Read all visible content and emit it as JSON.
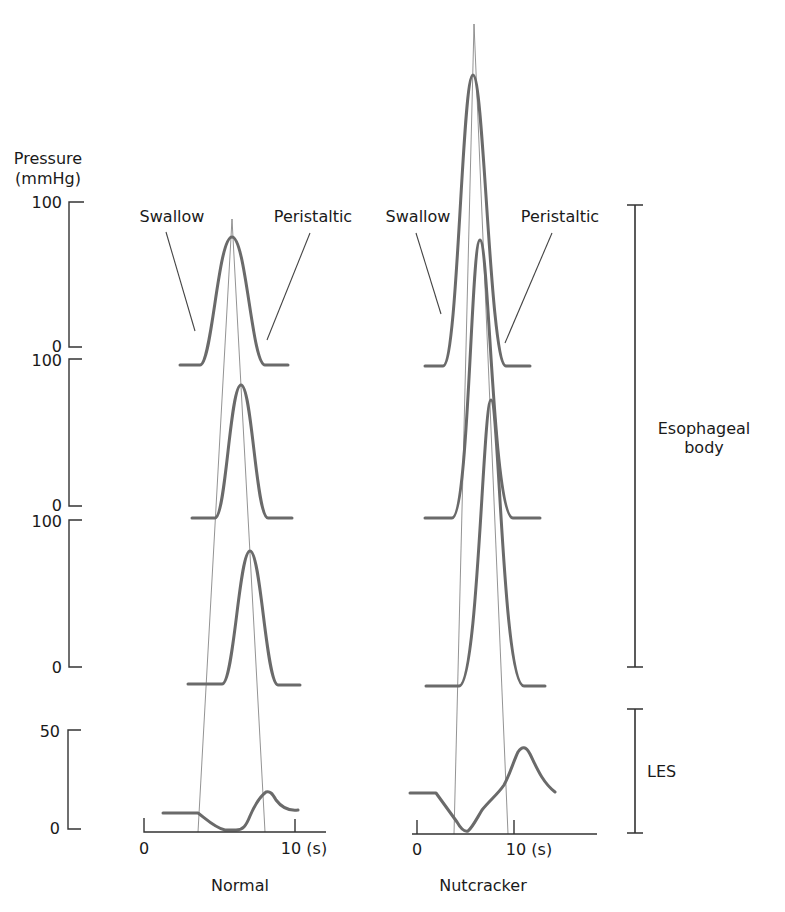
{
  "y_axis": {
    "title_line1": "Pressure",
    "title_line2": "(mmHg)",
    "body_scales": [
      {
        "top": "100",
        "bottom": "0"
      },
      {
        "top": "100",
        "bottom": "0"
      },
      {
        "top": "100",
        "bottom": "0"
      }
    ],
    "les_scale": {
      "top": "50",
      "bottom": "0"
    }
  },
  "panels": {
    "normal": {
      "title": "Normal",
      "swallow_label": "Swallow",
      "peristaltic_label": "Peristaltic",
      "x_tick_0": "0",
      "x_tick_10": "10 (s)"
    },
    "nutcracker": {
      "title": "Nutcracker",
      "swallow_label": "Swallow",
      "peristaltic_label": "Peristaltic",
      "x_tick_0": "0",
      "x_tick_10": "10 (s)"
    }
  },
  "regions": {
    "esophageal_body_line1": "Esophageal",
    "esophageal_body_line2": "body",
    "les": "LES"
  },
  "colors": {
    "trace": "#6a6a6a",
    "axis": "#333333",
    "text": "#1a1a1a"
  }
}
